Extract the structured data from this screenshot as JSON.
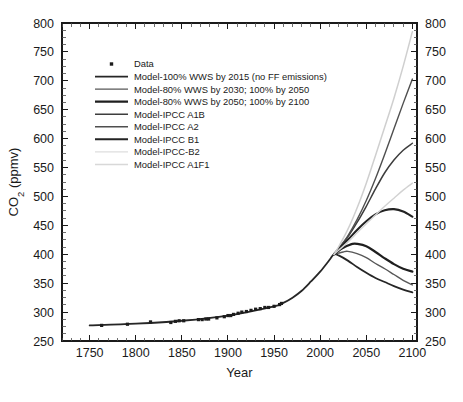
{
  "chart_data": {
    "type": "line",
    "title": "",
    "xlabel": "Year",
    "ylabel": "CO2 (ppmv)",
    "ylabel_display": "CO",
    "ylabel_sub": "2",
    "ylabel_rest": " (ppmv)",
    "xlim": [
      1720,
      2105
    ],
    "ylim": [
      250,
      800
    ],
    "x_ticks": [
      1750,
      1800,
      1850,
      1900,
      1950,
      2000,
      2050,
      2100
    ],
    "x_tick_labels": [
      "1750",
      "1800",
      "1850",
      "1900",
      "1950",
      "2000",
      "2050",
      "2100"
    ],
    "x_minor_step": 10,
    "y_ticks": [
      250,
      300,
      350,
      400,
      450,
      500,
      550,
      600,
      650,
      700,
      750,
      800
    ],
    "y_tick_labels": [
      "250",
      "300",
      "350",
      "400",
      "450",
      "500",
      "550",
      "600",
      "650",
      "700",
      "750",
      "800"
    ],
    "y_minor_step": 12.5,
    "grid": false,
    "legend_position": "upper-left",
    "right_axis_mirrored": true,
    "scatter": {
      "name": "Data",
      "marker": "square-dot",
      "color": "#1c1c1c",
      "points": [
        [
          1763,
          277
        ],
        [
          1791,
          279
        ],
        [
          1816,
          283
        ],
        [
          1838,
          282
        ],
        [
          1843,
          284
        ],
        [
          1847,
          285
        ],
        [
          1852,
          285
        ],
        [
          1868,
          287
        ],
        [
          1872,
          287
        ],
        [
          1876,
          288
        ],
        [
          1879,
          288
        ],
        [
          1888,
          290
        ],
        [
          1896,
          292
        ],
        [
          1900,
          294
        ],
        [
          1903,
          294
        ],
        [
          1906,
          296
        ],
        [
          1911,
          298
        ],
        [
          1915,
          300
        ],
        [
          1920,
          301
        ],
        [
          1925,
          303
        ],
        [
          1930,
          305
        ],
        [
          1935,
          306
        ],
        [
          1940,
          308
        ],
        [
          1944,
          308
        ],
        [
          1950,
          310
        ],
        [
          1956,
          313
        ],
        [
          1958,
          315
        ]
      ]
    },
    "series": [
      {
        "name": "Model-100% WWS by 2015 (no FF emissions)",
        "color": "#262626",
        "width": 1.8,
        "legend_swatch": "#262626",
        "points": [
          [
            1750,
            277
          ],
          [
            1800,
            280
          ],
          [
            1850,
            285
          ],
          [
            1900,
            294
          ],
          [
            1950,
            310
          ],
          [
            1960,
            316
          ],
          [
            1970,
            325
          ],
          [
            1980,
            337
          ],
          [
            1990,
            353
          ],
          [
            2000,
            370
          ],
          [
            2010,
            390
          ],
          [
            2015,
            400
          ],
          [
            2020,
            398
          ],
          [
            2030,
            389
          ],
          [
            2040,
            378
          ],
          [
            2050,
            368
          ],
          [
            2060,
            359
          ],
          [
            2070,
            352
          ],
          [
            2080,
            345
          ],
          [
            2090,
            339
          ],
          [
            2100,
            334
          ]
        ]
      },
      {
        "name": "Model-80% WWS by 2030; 100% by 2050",
        "color": "#575757",
        "width": 1.4,
        "legend_swatch": "#575757",
        "points": [
          [
            2015,
            400
          ],
          [
            2020,
            402
          ],
          [
            2025,
            404
          ],
          [
            2030,
            405
          ],
          [
            2040,
            401
          ],
          [
            2050,
            394
          ],
          [
            2060,
            384
          ],
          [
            2070,
            375
          ],
          [
            2080,
            365
          ],
          [
            2090,
            355
          ],
          [
            2100,
            347
          ]
        ]
      },
      {
        "name": "Model-80% WWS by 2050; 100% by 2100",
        "color": "#1f1f1f",
        "width": 2.2,
        "legend_swatch": "#1f1f1f",
        "points": [
          [
            2015,
            400
          ],
          [
            2020,
            406
          ],
          [
            2025,
            411
          ],
          [
            2030,
            415
          ],
          [
            2035,
            418
          ],
          [
            2040,
            418
          ],
          [
            2050,
            414
          ],
          [
            2060,
            404
          ],
          [
            2070,
            393
          ],
          [
            2080,
            383
          ],
          [
            2090,
            375
          ],
          [
            2100,
            370
          ]
        ]
      },
      {
        "name": "Model-IPCC A1B",
        "color": "#3d3d3d",
        "width": 1.5,
        "legend_swatch": "#3d3d3d",
        "points": [
          [
            2015,
            400
          ],
          [
            2020,
            410
          ],
          [
            2030,
            430
          ],
          [
            2040,
            455
          ],
          [
            2050,
            483
          ],
          [
            2060,
            513
          ],
          [
            2070,
            541
          ],
          [
            2080,
            563
          ],
          [
            2090,
            580
          ],
          [
            2100,
            592
          ]
        ]
      },
      {
        "name": "Model-IPCC A2",
        "color": "#4f4f4f",
        "width": 1.4,
        "legend_swatch": "#4f4f4f",
        "points": [
          [
            2015,
            400
          ],
          [
            2020,
            410
          ],
          [
            2030,
            432
          ],
          [
            2040,
            460
          ],
          [
            2050,
            493
          ],
          [
            2060,
            531
          ],
          [
            2070,
            573
          ],
          [
            2080,
            617
          ],
          [
            2090,
            661
          ],
          [
            2100,
            703
          ]
        ]
      },
      {
        "name": "Model-IPCC B1",
        "color": "#232323",
        "width": 2.1,
        "legend_swatch": "#232323",
        "points": [
          [
            2015,
            400
          ],
          [
            2020,
            409
          ],
          [
            2030,
            425
          ],
          [
            2040,
            442
          ],
          [
            2050,
            457
          ],
          [
            2060,
            469
          ],
          [
            2070,
            476
          ],
          [
            2080,
            478
          ],
          [
            2090,
            474
          ],
          [
            2100,
            465
          ]
        ]
      },
      {
        "name": "Model-IPCC-B2",
        "color": "#d2d2d2",
        "width": 1.4,
        "legend_swatch": "#dedede",
        "points": [
          [
            2015,
            400
          ],
          [
            2020,
            407
          ],
          [
            2030,
            421
          ],
          [
            2040,
            437
          ],
          [
            2050,
            453
          ],
          [
            2060,
            468
          ],
          [
            2070,
            483
          ],
          [
            2080,
            497
          ],
          [
            2090,
            511
          ],
          [
            2100,
            523
          ]
        ]
      },
      {
        "name": "Model-IPCC A1F1",
        "color": "#cfcfcf",
        "width": 1.5,
        "legend_swatch": "#d8d8d8",
        "points": [
          [
            2015,
            400
          ],
          [
            2020,
            413
          ],
          [
            2030,
            443
          ],
          [
            2040,
            480
          ],
          [
            2050,
            523
          ],
          [
            2060,
            571
          ],
          [
            2070,
            620
          ],
          [
            2080,
            670
          ],
          [
            2090,
            725
          ],
          [
            2100,
            785
          ]
        ]
      }
    ]
  },
  "legend": {
    "entries": [
      {
        "label": "Data",
        "type": "marker"
      },
      {
        "label": "Model-100% WWS by 2015 (no FF emissions)",
        "type": "line"
      },
      {
        "label": "Model-80% WWS by 2030; 100% by 2050",
        "type": "line"
      },
      {
        "label": "Model-80% WWS by 2050; 100% by 2100",
        "type": "line"
      },
      {
        "label": "Model-IPCC A1B",
        "type": "line"
      },
      {
        "label": "Model-IPCC A2",
        "type": "line"
      },
      {
        "label": "Model-IPCC B1",
        "type": "line"
      },
      {
        "label": "Model-IPCC-B2",
        "type": "line"
      },
      {
        "label": "Model-IPCC A1F1",
        "type": "line"
      }
    ]
  }
}
